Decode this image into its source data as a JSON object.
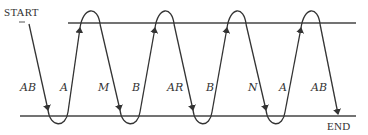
{
  "diagram": {
    "start_label": "START",
    "end_label": "END",
    "line_color": "#333333",
    "segments": [
      {
        "label": "AB",
        "direction": "down"
      },
      {
        "label": "A",
        "direction": "up"
      },
      {
        "label": "M",
        "direction": "down"
      },
      {
        "label": "B",
        "direction": "up"
      },
      {
        "label": "AR",
        "direction": "down"
      },
      {
        "label": "B",
        "direction": "up"
      },
      {
        "label": "N",
        "direction": "down"
      },
      {
        "label": "A",
        "direction": "up"
      },
      {
        "label": "AB",
        "direction": "down"
      }
    ]
  }
}
